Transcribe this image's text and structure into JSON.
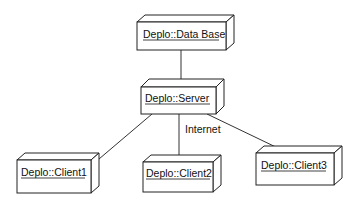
{
  "diagram": {
    "type": "UML deployment diagram",
    "nodes": [
      {
        "id": "database",
        "label": "Deplo::Data Base",
        "x": 137,
        "y": 22,
        "w": 89,
        "h": 28
      },
      {
        "id": "server",
        "label": "Deplo::Server",
        "x": 141,
        "y": 87,
        "w": 75,
        "h": 27
      },
      {
        "id": "client1",
        "label": "Deplo::Client1",
        "x": 17,
        "y": 160,
        "w": 74,
        "h": 33
      },
      {
        "id": "client2",
        "label": "Deplo::Client2",
        "x": 143,
        "y": 162,
        "w": 70,
        "h": 30
      },
      {
        "id": "client3",
        "label": "Deplo::Client3",
        "x": 256,
        "y": 153,
        "w": 78,
        "h": 32
      }
    ],
    "edges": [
      {
        "from": "database",
        "to": "server",
        "label": ""
      },
      {
        "from": "server",
        "to": "client1",
        "label": ""
      },
      {
        "from": "server",
        "to": "client2",
        "label": "Internet"
      },
      {
        "from": "server",
        "to": "client3",
        "label": ""
      }
    ],
    "edge_label": "Internet"
  }
}
